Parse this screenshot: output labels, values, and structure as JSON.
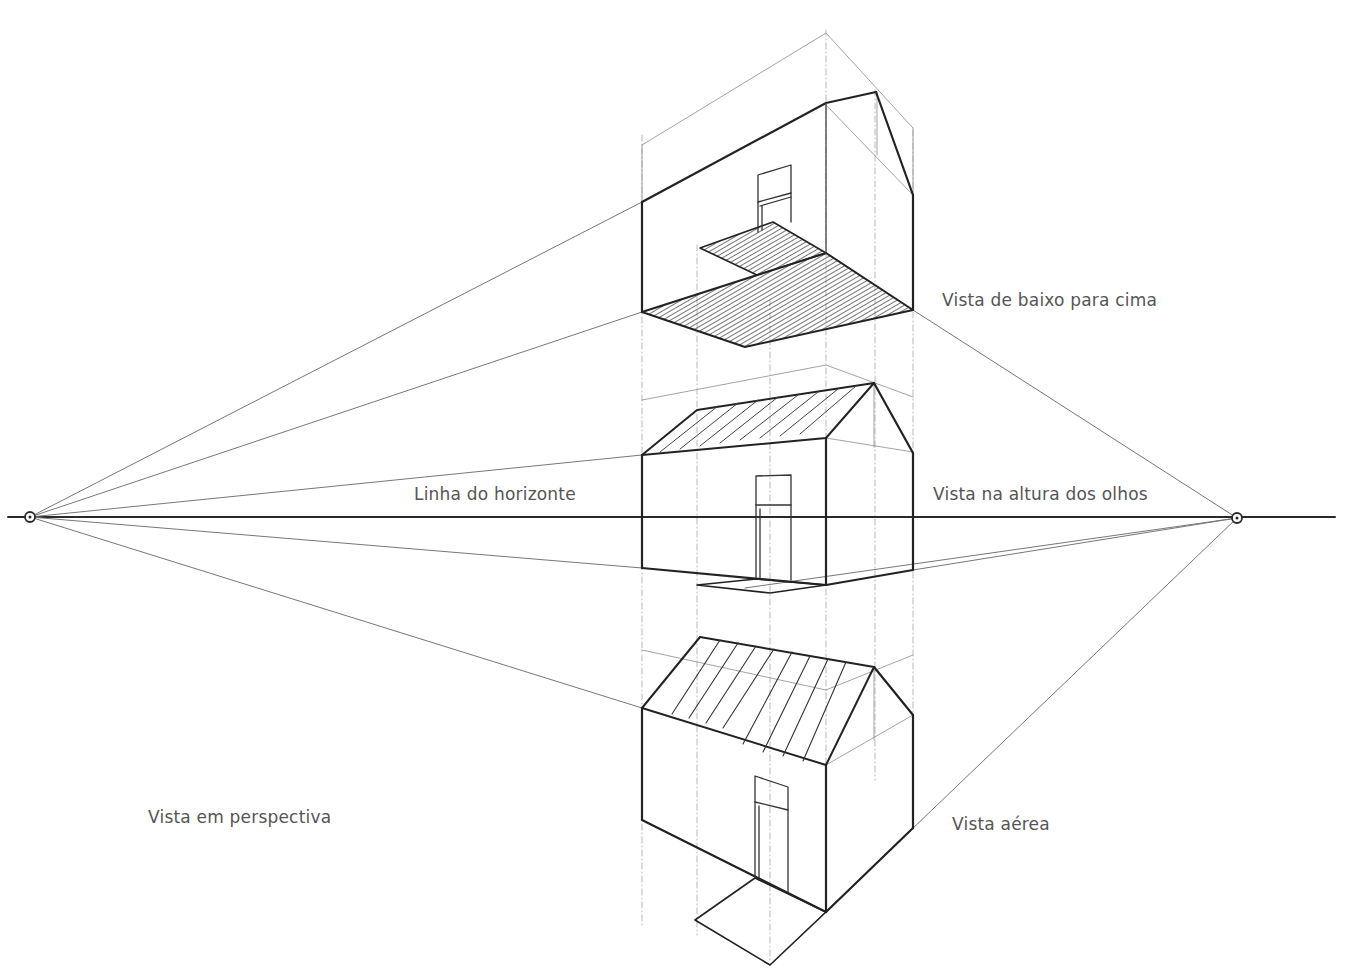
{
  "diagram": {
    "colors": {
      "ink": "#2a2a2a",
      "guide": "#8a8a8a",
      "faint": "#b5b5b5",
      "label": "#555555",
      "background": "#ffffff"
    },
    "horizon": {
      "y": 517,
      "x1": 8,
      "x2": 1335
    },
    "vanishing_points": [
      {
        "name": "left",
        "x": 30,
        "y": 517
      },
      {
        "name": "right",
        "x": 1237,
        "y": 518
      }
    ],
    "labels": {
      "worms_eye": "Vista de baixo para cima",
      "horizon_line": "Linha do horizonte",
      "eye_level": "Vista na altura dos olhos",
      "perspective": "Vista em perspectiva",
      "aerial": "Vista aérea"
    },
    "label_positions": {
      "worms_eye": {
        "x": 942,
        "y": 290
      },
      "horizon_line": {
        "x": 414,
        "y": 484
      },
      "eye_level": {
        "x": 933,
        "y": 484
      },
      "perspective": {
        "x": 148,
        "y": 807
      },
      "aerial": {
        "x": 952,
        "y": 814
      }
    },
    "houses": [
      {
        "name": "worms-eye-house",
        "view": "Vista de baixo para cima"
      },
      {
        "name": "eye-level-house",
        "view": "Vista na altura dos olhos"
      },
      {
        "name": "aerial-house",
        "view": "Vista aérea"
      }
    ]
  }
}
